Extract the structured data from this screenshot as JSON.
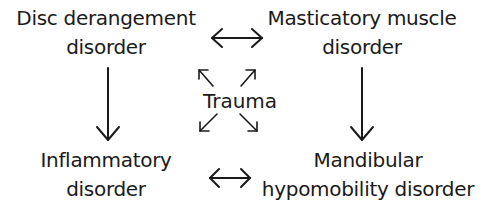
{
  "diagram": {
    "type": "relationship-diagram",
    "nodes": [
      {
        "id": "disc",
        "lines": [
          "Disc derangement",
          "disorder"
        ]
      },
      {
        "id": "mast",
        "lines": [
          "Masticatory muscle",
          "disorder"
        ]
      },
      {
        "id": "infl",
        "lines": [
          "Inflammatory",
          "disorder"
        ]
      },
      {
        "id": "mand",
        "lines": [
          "Mandibular",
          "hypomobility disorder"
        ]
      }
    ],
    "center": {
      "id": "trauma",
      "label": "Trauma"
    },
    "edges": [
      {
        "from": "disc",
        "to": "mast",
        "type": "bidirectional"
      },
      {
        "from": "infl",
        "to": "mand",
        "type": "bidirectional"
      },
      {
        "from": "disc",
        "to": "infl",
        "type": "directed"
      },
      {
        "from": "mast",
        "to": "mand",
        "type": "directed"
      },
      {
        "from": "trauma",
        "to": "disc",
        "type": "directed"
      },
      {
        "from": "trauma",
        "to": "mast",
        "type": "directed"
      },
      {
        "from": "trauma",
        "to": "infl",
        "type": "directed"
      },
      {
        "from": "trauma",
        "to": "mand",
        "type": "directed"
      }
    ]
  }
}
